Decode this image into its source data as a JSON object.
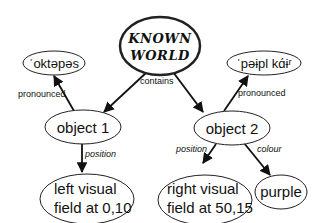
{
  "diagram": {
    "nodes": {
      "root": {
        "line1": "KNOWN",
        "line2": "WORLD"
      },
      "pron1": {
        "label": "ˈoktəpəs"
      },
      "pron2": {
        "label": "ˈpəɨpl kɑ́ɨʳ"
      },
      "object1": {
        "label": "object 1"
      },
      "object2": {
        "label": "object 2"
      },
      "pos1": {
        "line1": "left visual",
        "line2": "field at 0,10"
      },
      "pos2": {
        "line1": "right visual",
        "line2": "field at 50,15"
      },
      "colour": {
        "label": "purple"
      }
    },
    "edges": {
      "contains": "contains",
      "pronounced1": "pronounced",
      "pronounced2": "pronounced",
      "position1": "position",
      "position2": "position",
      "colour": "colour"
    }
  }
}
